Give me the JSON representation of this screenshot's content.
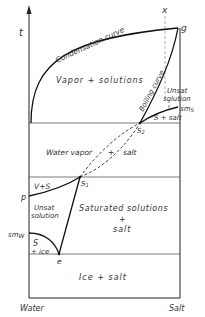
{
  "diagram": {
    "type": "phase-diagram",
    "axes": {
      "y_label": "t",
      "x_left_label": "Water",
      "x_right_label": "Salt"
    },
    "curves": {
      "condensation": "Condensation curve",
      "boiling": "Boiling curve"
    },
    "regions": {
      "vapor_solutions": "Vapor + solutions",
      "unsat_solution_top_l1": "Unsat",
      "unsat_solution_top_l2": "solution",
      "s_salt": "S + salt",
      "water_vapor": "Water vapor",
      "water_vapor_plus": "+",
      "water_vapor_salt": "salt",
      "v_s": "V+S",
      "unsat_solution_left_l1": "Unsat",
      "unsat_solution_left_l2": "solution",
      "saturated_l1": "Saturated solutions",
      "saturated_l2": "+",
      "saturated_l3": "salt",
      "s_ice_l1": "S",
      "s_ice_l2": "+ ice",
      "ice_salt": "Ice + salt"
    },
    "points": {
      "x": "x",
      "g": "g",
      "sm_s": "sm",
      "sm_s_sub": "S",
      "s2": "S",
      "s2_sub": "2",
      "s1": "S",
      "s1_sub": "1",
      "p": "p",
      "sm_w": "sm",
      "sm_w_sub": "W",
      "e": "e"
    }
  }
}
